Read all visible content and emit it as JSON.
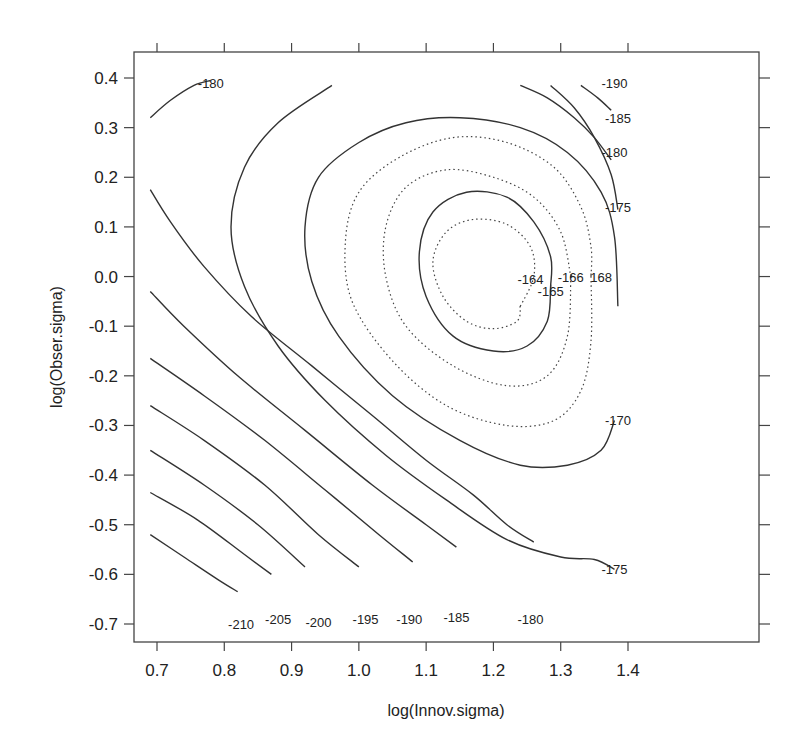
{
  "chart_data": {
    "type": "contour",
    "title": "",
    "xlabel": "log(Innov.sigma)",
    "ylabel": "log(Obser.sigma)",
    "xlim": [
      0.665,
      1.415
    ],
    "ylim": [
      -0.74,
      0.455
    ],
    "x_ticks": [
      0.7,
      0.8,
      0.9,
      1.0,
      1.1,
      1.2,
      1.3,
      1.4
    ],
    "x_tick_labels": [
      "0.7",
      "0.8",
      "0.9",
      "1.0",
      "1.1",
      "1.2",
      "1.3",
      "1.4"
    ],
    "y_ticks": [
      0.4,
      0.3,
      0.2,
      0.1,
      0.0,
      -0.1,
      -0.2,
      -0.3,
      -0.4,
      -0.5,
      -0.6,
      -0.7
    ],
    "y_tick_labels": [
      "0.4",
      "0.3",
      "0.2",
      "0.1",
      "0.0",
      "-0.1",
      "-0.2",
      "-0.3",
      "-0.4",
      "-0.5",
      "-0.6",
      "-0.7"
    ],
    "grid": false,
    "maximum_approx": {
      "x": 1.18,
      "y": 0.02
    },
    "contour_levels": [
      -164,
      -165,
      -166,
      -168,
      -170,
      -175,
      -180,
      -185,
      -190,
      -195,
      -200,
      -205,
      -210
    ],
    "contour_labels": [
      {
        "text": "-180",
        "x": 0.78,
        "y": 0.39
      },
      {
        "text": "-190",
        "x": 1.38,
        "y": 0.39
      },
      {
        "text": "-185",
        "x": 1.385,
        "y": 0.32
      },
      {
        "text": "-180",
        "x": 1.38,
        "y": 0.25
      },
      {
        "text": "-175",
        "x": 1.385,
        "y": 0.14
      },
      {
        "text": "-164",
        "x": 1.255,
        "y": -0.005
      },
      {
        "text": "-165",
        "x": 1.285,
        "y": -0.03
      },
      {
        "text": "-166",
        "x": 1.315,
        "y": -0.0
      },
      {
        "text": "168",
        "x": 1.36,
        "y": -0.0
      },
      {
        "text": "-170",
        "x": 1.385,
        "y": -0.29
      },
      {
        "text": "-175",
        "x": 1.38,
        "y": -0.59
      },
      {
        "text": "-180",
        "x": 1.255,
        "y": -0.69
      },
      {
        "text": "-185",
        "x": 1.145,
        "y": -0.685
      },
      {
        "text": "-190",
        "x": 1.075,
        "y": -0.69
      },
      {
        "text": "-195",
        "x": 1.01,
        "y": -0.69
      },
      {
        "text": "-200",
        "x": 0.94,
        "y": -0.695
      },
      {
        "text": "-205",
        "x": 0.88,
        "y": -0.69
      },
      {
        "text": "-210",
        "x": 0.825,
        "y": -0.7
      }
    ],
    "contours": [
      {
        "level": -164,
        "style": "dotted",
        "points": [
          [
            1.24,
            -0.06
          ],
          [
            1.26,
            0.0
          ],
          [
            1.255,
            0.06
          ],
          [
            1.22,
            0.105
          ],
          [
            1.17,
            0.115
          ],
          [
            1.13,
            0.09
          ],
          [
            1.11,
            0.03
          ],
          [
            1.125,
            -0.04
          ],
          [
            1.16,
            -0.09
          ],
          [
            1.2,
            -0.105
          ],
          [
            1.235,
            -0.09
          ],
          [
            1.24,
            -0.06
          ]
        ],
        "closed": true
      },
      {
        "level": -165,
        "style": "solid",
        "points": [
          [
            1.285,
            -0.02
          ],
          [
            1.28,
            -0.09
          ],
          [
            1.25,
            -0.14
          ],
          [
            1.2,
            -0.15
          ],
          [
            1.14,
            -0.12
          ],
          [
            1.1,
            -0.04
          ],
          [
            1.09,
            0.05
          ],
          [
            1.11,
            0.13
          ],
          [
            1.16,
            0.17
          ],
          [
            1.22,
            0.16
          ],
          [
            1.26,
            0.11
          ],
          [
            1.285,
            0.04
          ],
          [
            1.285,
            -0.02
          ]
        ],
        "closed": true
      },
      {
        "level": -166,
        "style": "dotted",
        "points": [
          [
            1.315,
            0.0
          ],
          [
            1.31,
            -0.12
          ],
          [
            1.28,
            -0.2
          ],
          [
            1.22,
            -0.22
          ],
          [
            1.14,
            -0.18
          ],
          [
            1.07,
            -0.1
          ],
          [
            1.04,
            0.0
          ],
          [
            1.04,
            0.1
          ],
          [
            1.07,
            0.18
          ],
          [
            1.13,
            0.215
          ],
          [
            1.2,
            0.2
          ],
          [
            1.26,
            0.16
          ],
          [
            1.3,
            0.09
          ],
          [
            1.315,
            0.0
          ]
        ],
        "closed": true
      },
      {
        "level": -168,
        "style": "dotted",
        "points": [
          [
            1.345,
            0.0
          ],
          [
            1.345,
            -0.13
          ],
          [
            1.33,
            -0.23
          ],
          [
            1.29,
            -0.29
          ],
          [
            1.22,
            -0.3
          ],
          [
            1.13,
            -0.26
          ],
          [
            1.05,
            -0.17
          ],
          [
            0.99,
            -0.05
          ],
          [
            0.98,
            0.07
          ],
          [
            1.0,
            0.17
          ],
          [
            1.06,
            0.24
          ],
          [
            1.14,
            0.28
          ],
          [
            1.22,
            0.27
          ],
          [
            1.29,
            0.22
          ],
          [
            1.33,
            0.14
          ],
          [
            1.345,
            0.06
          ],
          [
            1.345,
            0.0
          ]
        ],
        "closed": true
      },
      {
        "level": -170,
        "style": "solid",
        "points": [
          [
            1.38,
            -0.29
          ],
          [
            1.36,
            -0.35
          ],
          [
            1.31,
            -0.38
          ],
          [
            1.24,
            -0.38
          ],
          [
            1.15,
            -0.33
          ],
          [
            1.05,
            -0.24
          ],
          [
            0.97,
            -0.12
          ],
          [
            0.93,
            -0.01
          ],
          [
            0.92,
            0.1
          ],
          [
            0.94,
            0.2
          ],
          [
            1.0,
            0.27
          ],
          [
            1.07,
            0.31
          ],
          [
            1.15,
            0.32
          ],
          [
            1.24,
            0.3
          ],
          [
            1.31,
            0.25
          ],
          [
            1.36,
            0.17
          ],
          [
            1.38,
            0.08
          ],
          [
            1.385,
            -0.06
          ]
        ],
        "closed": false
      },
      {
        "level": -175,
        "style": "solid",
        "points": [
          [
            1.38,
            -0.59
          ],
          [
            1.35,
            -0.57
          ],
          [
            1.3,
            -0.565
          ],
          [
            1.22,
            -0.53
          ],
          [
            1.13,
            -0.45
          ],
          [
            1.04,
            -0.36
          ],
          [
            0.95,
            -0.25
          ],
          [
            0.88,
            -0.14
          ],
          [
            0.83,
            -0.02
          ],
          [
            0.81,
            0.1
          ],
          [
            0.83,
            0.22
          ],
          [
            0.88,
            0.31
          ],
          [
            0.96,
            0.385
          ]
        ],
        "closed": false
      },
      {
        "level": -175,
        "style": "solid",
        "points": [
          [
            1.285,
            0.385
          ],
          [
            1.32,
            0.34
          ],
          [
            1.35,
            0.28
          ],
          [
            1.375,
            0.205
          ],
          [
            1.385,
            0.135
          ]
        ],
        "closed": false
      },
      {
        "level": -180,
        "style": "solid",
        "points": [
          [
            0.69,
            0.32
          ],
          [
            0.72,
            0.355
          ],
          [
            0.755,
            0.385
          ],
          [
            0.78,
            0.395
          ]
        ],
        "closed": false
      },
      {
        "level": -180,
        "style": "solid",
        "points": [
          [
            0.69,
            0.175
          ],
          [
            0.72,
            0.11
          ],
          [
            0.77,
            0.02
          ],
          [
            0.84,
            -0.08
          ],
          [
            0.93,
            -0.18
          ],
          [
            1.02,
            -0.28
          ],
          [
            1.1,
            -0.37
          ],
          [
            1.17,
            -0.44
          ],
          [
            1.22,
            -0.5
          ],
          [
            1.26,
            -0.535
          ]
        ],
        "closed": false
      },
      {
        "level": -180,
        "style": "solid",
        "points": [
          [
            1.24,
            0.385
          ],
          [
            1.28,
            0.36
          ],
          [
            1.32,
            0.32
          ],
          [
            1.35,
            0.28
          ],
          [
            1.375,
            0.235
          ]
        ],
        "closed": false
      },
      {
        "level": -185,
        "style": "solid",
        "points": [
          [
            0.69,
            -0.03
          ],
          [
            0.74,
            -0.1
          ],
          [
            0.82,
            -0.2
          ],
          [
            0.92,
            -0.31
          ],
          [
            1.02,
            -0.42
          ],
          [
            1.1,
            -0.5
          ],
          [
            1.145,
            -0.545
          ]
        ],
        "closed": false
      },
      {
        "level": -185,
        "style": "solid",
        "points": [
          [
            1.33,
            0.385
          ],
          [
            1.355,
            0.36
          ],
          [
            1.375,
            0.335
          ]
        ],
        "closed": false
      },
      {
        "level": -190,
        "style": "solid",
        "points": [
          [
            0.69,
            -0.165
          ],
          [
            0.77,
            -0.24
          ],
          [
            0.86,
            -0.33
          ],
          [
            0.95,
            -0.43
          ],
          [
            1.03,
            -0.52
          ],
          [
            1.08,
            -0.575
          ]
        ],
        "closed": false
      },
      {
        "level": -195,
        "style": "solid",
        "points": [
          [
            0.69,
            -0.26
          ],
          [
            0.77,
            -0.33
          ],
          [
            0.86,
            -0.42
          ],
          [
            0.94,
            -0.52
          ],
          [
            1.0,
            -0.585
          ]
        ],
        "closed": false
      },
      {
        "level": -200,
        "style": "solid",
        "points": [
          [
            0.69,
            -0.35
          ],
          [
            0.77,
            -0.42
          ],
          [
            0.85,
            -0.5
          ],
          [
            0.92,
            -0.585
          ]
        ],
        "closed": false
      },
      {
        "level": -205,
        "style": "solid",
        "points": [
          [
            0.69,
            -0.435
          ],
          [
            0.76,
            -0.49
          ],
          [
            0.83,
            -0.56
          ],
          [
            0.87,
            -0.6
          ]
        ],
        "closed": false
      },
      {
        "level": -210,
        "style": "solid",
        "points": [
          [
            0.69,
            -0.52
          ],
          [
            0.74,
            -0.565
          ],
          [
            0.79,
            -0.61
          ],
          [
            0.82,
            -0.635
          ]
        ],
        "closed": false
      }
    ]
  },
  "layout": {
    "plot_box": {
      "left": 134,
      "top": 52,
      "right": 759,
      "bottom": 642
    },
    "x_px": {
      "v0": 0.7,
      "p0": 157,
      "v1": 1.4,
      "p1": 628
    },
    "y_px": {
      "v0": 0.4,
      "p0": 78,
      "v1": -0.7,
      "p1": 624
    }
  }
}
